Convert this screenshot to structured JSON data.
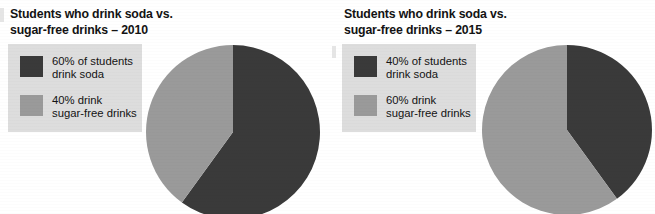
{
  "figure": {
    "background_color": "#ffffff",
    "dark_color": "#3a3a3a",
    "light_color": "#9a9a9a",
    "legend_background": "#dddddd"
  },
  "charts": [
    {
      "id": "soda-2010",
      "title_line1": "Students who drink soda vs.",
      "title_line2": "sugar-free drinks – 2010",
      "legend": [
        {
          "swatch_color": "#3a3a3a",
          "line1": "60% of students",
          "line2": "drink soda"
        },
        {
          "swatch_color": "#9a9a9a",
          "line1": "40% drink",
          "line2": "sugar-free drinks"
        }
      ]
    },
    {
      "id": "soda-2015",
      "title_line1": "Students who drink soda vs.",
      "title_line2": "sugar-free drinks – 2015",
      "legend": [
        {
          "swatch_color": "#3a3a3a",
          "line1": "40% of students",
          "line2": "drink soda"
        },
        {
          "swatch_color": "#9a9a9a",
          "line1": "60% drink",
          "line2": "sugar-free drinks"
        }
      ]
    }
  ],
  "chart_data": [
    {
      "type": "pie",
      "title": "Students who drink soda vs. sugar-free drinks – 2010",
      "categories": [
        "60% of students drink soda",
        "40% drink sugar-free drinks"
      ],
      "labels": [
        "drink soda",
        "drink sugar-free drinks"
      ],
      "values": [
        60,
        40
      ],
      "unit": "percent",
      "colors": [
        "#3a3a3a",
        "#9a9a9a"
      ],
      "start_angle_deg": 0,
      "direction": "clockwise",
      "legend": "left",
      "grid": false
    },
    {
      "type": "pie",
      "title": "Students who drink soda vs. sugar-free drinks – 2015",
      "categories": [
        "40% of students drink soda",
        "60% drink sugar-free drinks"
      ],
      "labels": [
        "drink soda",
        "drink sugar-free drinks"
      ],
      "values": [
        40,
        60
      ],
      "unit": "percent",
      "colors": [
        "#3a3a3a",
        "#9a9a9a"
      ],
      "start_angle_deg": 0,
      "direction": "clockwise",
      "legend": "left",
      "grid": false
    }
  ]
}
